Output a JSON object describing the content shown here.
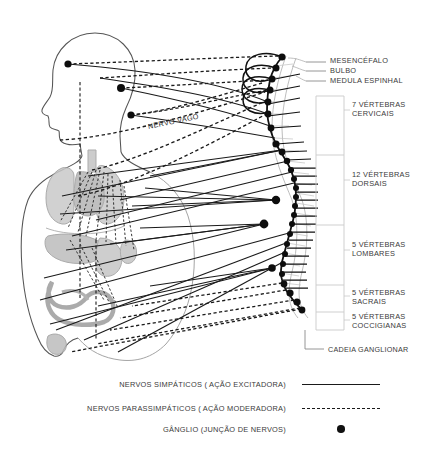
{
  "figure": {
    "background_color": "#ffffff",
    "ink_color": "#1a1a1a",
    "organ_color": "#b8b8b8",
    "body_outline_color": "#555555"
  },
  "top_labels": [
    {
      "id": "mesencefalo",
      "text": "MESENCÉFALO",
      "x": 330,
      "y": 57,
      "leader_y": 62
    },
    {
      "id": "bulbo",
      "text": "BULBO",
      "x": 330,
      "y": 66,
      "leader_y": 71
    },
    {
      "id": "medula-espinhal",
      "text": "MEDULA ESPINHAL",
      "x": 330,
      "y": 76,
      "leader_y": 81
    }
  ],
  "segments": [
    {
      "id": "cervicais",
      "text": "7 VÉRTEBRAS\nCERVICAIS",
      "x": 352,
      "y": 100,
      "bracket_top": 96,
      "bracket_bottom": 155
    },
    {
      "id": "dorsais",
      "text": "12 VÉRTEBRAS\nDORSAIS",
      "x": 352,
      "y": 170,
      "bracket_top": 155,
      "bracket_bottom": 225
    },
    {
      "id": "lombares",
      "text": "5 VÉRTEBRAS\nLOMBARES",
      "x": 352,
      "y": 240,
      "bracket_top": 225,
      "bracket_bottom": 285
    },
    {
      "id": "sacrais",
      "text": "5 VÉRTEBRAS\nSACRAIS",
      "x": 352,
      "y": 289,
      "bracket_top": 285,
      "bracket_bottom": 312
    },
    {
      "id": "coccigianas",
      "text": "5 VÉRTEBRAS\nCOCCIGIANAS",
      "x": 352,
      "y": 313,
      "bracket_top": 312,
      "bracket_bottom": 330
    }
  ],
  "chain_label": {
    "id": "cadeia-ganglionar",
    "text": "CADEIA GANGLIONAR",
    "x": 328,
    "y": 345,
    "leader_y": 349
  },
  "vagus_label": {
    "id": "nervo-vago",
    "text": "NERVO VAGO",
    "x": 148,
    "y": 122
  },
  "legend": {
    "rows": [
      {
        "id": "simpaticos",
        "text": "NERVOS SIMPÁTICOS ( AÇÃO EXCITADORA)",
        "sample": "solid-line",
        "y": 375
      },
      {
        "id": "parassimpaticos",
        "text": "NERVOS PARASSIMPÁTICOS ( AÇÃO MODERADORA)",
        "sample": "dashed-line",
        "y": 399
      },
      {
        "id": "ganglio",
        "text": "GÂNGLIO (JUNÇÃO DE NERVOS)",
        "sample": "dot",
        "y": 420
      }
    ]
  },
  "ganglia": {
    "description": "Black filled circles marking nerve junctions along the sympathetic chain and in the body.",
    "chain_points": [
      {
        "x": 282,
        "y": 57
      },
      {
        "x": 276,
        "y": 68
      },
      {
        "x": 272,
        "y": 79
      },
      {
        "x": 270,
        "y": 90
      },
      {
        "x": 268,
        "y": 102
      },
      {
        "x": 268,
        "y": 114
      },
      {
        "x": 270,
        "y": 126
      },
      {
        "x": 275,
        "y": 138
      },
      {
        "x": 282,
        "y": 150
      },
      {
        "x": 288,
        "y": 161
      },
      {
        "x": 292,
        "y": 172
      },
      {
        "x": 295,
        "y": 183
      },
      {
        "x": 296,
        "y": 193
      },
      {
        "x": 296,
        "y": 203
      },
      {
        "x": 294,
        "y": 213
      },
      {
        "x": 292,
        "y": 223
      },
      {
        "x": 289,
        "y": 233
      },
      {
        "x": 286,
        "y": 243
      },
      {
        "x": 283,
        "y": 253
      },
      {
        "x": 281,
        "y": 263
      },
      {
        "x": 280,
        "y": 273
      },
      {
        "x": 282,
        "y": 283
      },
      {
        "x": 287,
        "y": 292
      },
      {
        "x": 294,
        "y": 300
      },
      {
        "x": 300,
        "y": 308
      }
    ],
    "body_points": [
      {
        "x": 68,
        "y": 64
      },
      {
        "x": 121,
        "y": 88
      },
      {
        "x": 131,
        "y": 115
      },
      {
        "x": 264,
        "y": 224
      },
      {
        "x": 276,
        "y": 200
      },
      {
        "x": 272,
        "y": 268
      }
    ]
  }
}
